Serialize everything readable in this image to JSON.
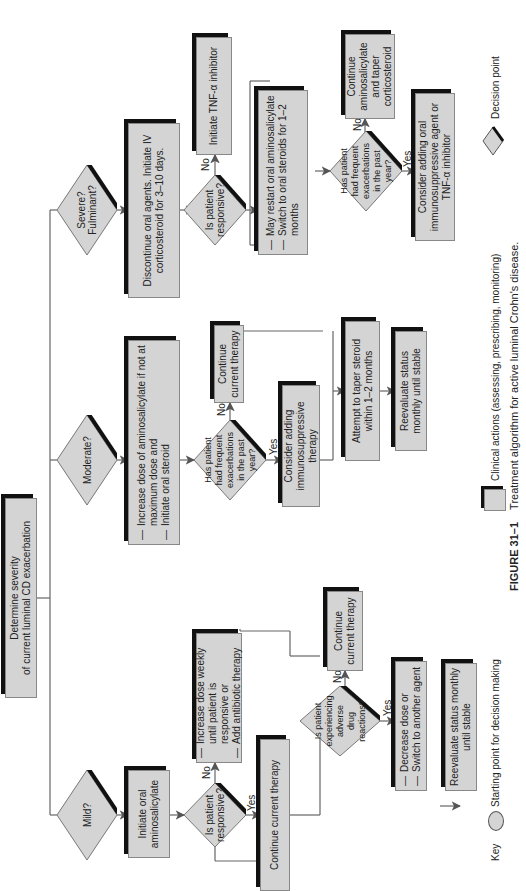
{
  "figure": {
    "number": "FIGURE 31–1",
    "caption": "Treatment algorithm for active luminal Crohn's disease."
  },
  "start": {
    "line1": "Determine severity",
    "line2": "of current luminal CD exacerbation"
  },
  "mild": {
    "decision": "Mild?",
    "action": "Initiate oral aminosalicylate",
    "responsive_q": "Is patient responsive?",
    "no_label": "No",
    "yes_label": "Yes",
    "no_action": [
      "Increase dose weekly until patient is responsive or",
      "Add antibiotic therapy"
    ],
    "yes_action": "Continue current therapy",
    "adverse_q": "Is patient experiencing adverse drug reactions?",
    "adverse_no_label": "No",
    "adverse_yes_label": "Yes",
    "adverse_no_action": "Continue current therapy",
    "adverse_yes_action": [
      "Decrease dose or",
      "Switch to another agent"
    ],
    "final": "Reevaluate status monthly until stable"
  },
  "moderate": {
    "decision": "Moderate?",
    "action": [
      "Increase dose of aminosalicylate if not at maximum dose and",
      "Initiate oral steroid"
    ],
    "frequent_q": "Has patient had frequent exacerbations in the past year?",
    "no_label": "No",
    "yes_label": "Yes",
    "no_action": "Continue current therapy",
    "yes_action": "Consider adding immunosuppressive therapy",
    "taper": "Attempt to taper steroid within 1–2 months",
    "final": "Reevaluate status monthly until stable"
  },
  "severe": {
    "decision": "Severe? Fulminant?",
    "action": "Discontinue oral agents. Initiate IV corticosteroid for 3–10 days.",
    "responsive_q": "Is patient responsive?",
    "no_label": "No",
    "no_action": "Initiate TNF-α inhibitor",
    "next_action": [
      "May restart oral aminosalicylate",
      "Switch to oral steroids for 1–2 months"
    ],
    "frequent_q": "Has patient had frequent exacerbations in the past year?",
    "freq_no_label": "No",
    "freq_yes_label": "Yes",
    "freq_no_action": "Continue aminosalicylate and taper corticosteroid",
    "freq_yes_action": "Consider adding oral immunosuppressive agent or TNF-α inhibitor"
  },
  "key": {
    "title": "Key",
    "start_point": "Starting point for decision making",
    "clinical_actions": "Clinical actions (assessing, prescribing, monitoring)",
    "decision_point": "Decision point"
  }
}
